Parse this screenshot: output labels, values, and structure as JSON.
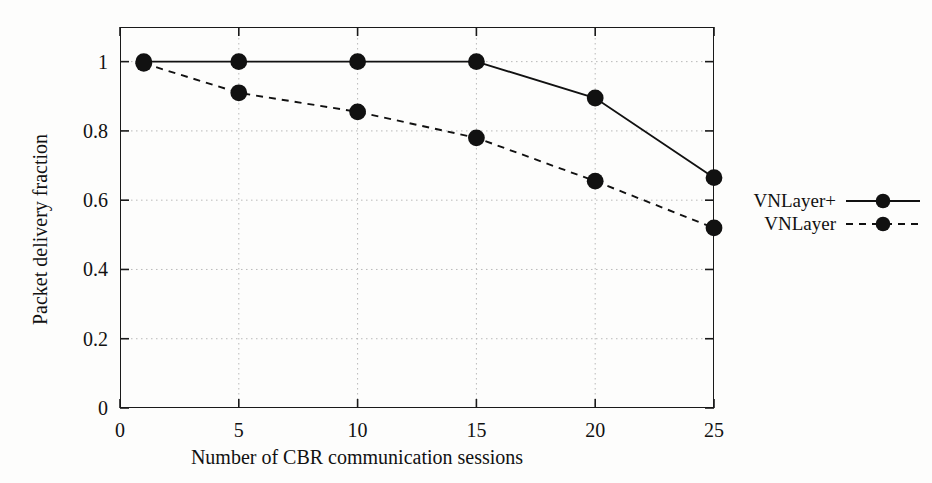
{
  "chart_data": {
    "type": "line",
    "title": "",
    "xlabel": "Number of CBR communication sessions",
    "ylabel": "Packet delivery fraction",
    "xlim": [
      0,
      25
    ],
    "ylim": [
      0,
      1.1
    ],
    "xticks": [
      "0",
      "5",
      "10",
      "15",
      "20",
      "25"
    ],
    "xtick_values": [
      0,
      5,
      10,
      15,
      20,
      25
    ],
    "yticks": [
      "0",
      "0.2",
      "0.4",
      "0.6",
      "0.8",
      "1"
    ],
    "ytick_values": [
      0,
      0.2,
      0.4,
      0.6,
      0.8,
      1
    ],
    "grid": true,
    "legend_position": "right",
    "x": [
      1,
      5,
      10,
      15,
      20,
      25
    ],
    "series": [
      {
        "name": "VNLayer+",
        "values": [
          1.0,
          1.0,
          1.0,
          1.0,
          0.895,
          0.665
        ],
        "style": "solid",
        "marker": "filled-circle",
        "color": "#111111"
      },
      {
        "name": "VNLayer",
        "values": [
          0.995,
          0.91,
          0.855,
          0.78,
          0.655,
          0.52
        ],
        "style": "dashed",
        "marker": "filled-circle",
        "color": "#111111"
      }
    ]
  },
  "legend": {
    "entries": [
      {
        "label": "VNLayer+"
      },
      {
        "label": "VNLayer"
      }
    ]
  },
  "colors": {
    "axis": "#1a1a1a",
    "grid": "#b9b9b9",
    "data": "#111111",
    "background": "#fdfdfc"
  }
}
